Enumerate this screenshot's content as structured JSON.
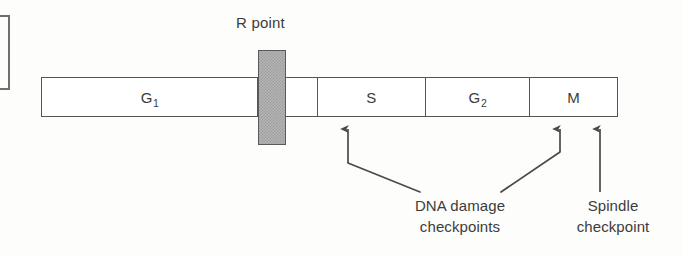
{
  "figure": {
    "background_color": "#fdfdfb",
    "line_color": "#555555",
    "text_color": "#3c3c3c",
    "rpoint_fill_color": "#b4b4b4"
  },
  "cycle_bar": {
    "segments": [
      {
        "id": "g1",
        "label": "G",
        "subscript": "1",
        "width_px": 217
      },
      {
        "id": "post_r",
        "label": "",
        "subscript": "",
        "width_px": 60
      },
      {
        "id": "s",
        "label": "S",
        "subscript": "",
        "width_px": 108
      },
      {
        "id": "g2",
        "label": "G",
        "subscript": "2",
        "width_px": 105
      },
      {
        "id": "m",
        "label": "M",
        "subscript": "",
        "width_px": 87
      }
    ]
  },
  "rpoint": {
    "label": "R point"
  },
  "annotations": [
    {
      "id": "dna-damage",
      "line1": "DNA damage",
      "line2": "checkpoints"
    },
    {
      "id": "spindle",
      "line1": "Spindle",
      "line2": "checkpoint"
    }
  ],
  "arrows": [
    {
      "id": "arrow-s-phase",
      "tip_x": 348,
      "tip_y": 122,
      "points_to": "S"
    },
    {
      "id": "arrow-g2-phase",
      "tip_x": 560,
      "tip_y": 122,
      "points_to": "G2"
    },
    {
      "id": "arrow-m-phase",
      "tip_x": 600,
      "tip_y": 122,
      "points_to": "M"
    }
  ]
}
